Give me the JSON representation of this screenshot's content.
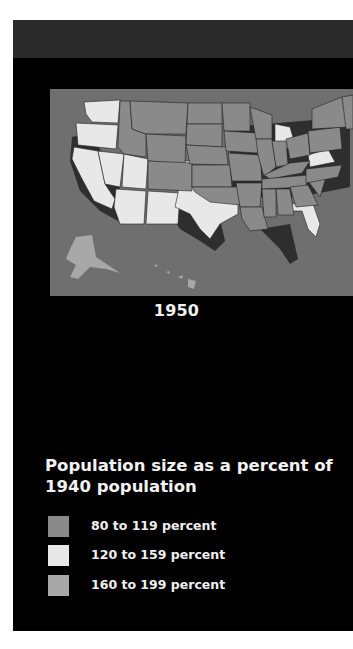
{
  "figure": {
    "year_label": "1950"
  },
  "legend": {
    "title": "Population size as a percent of 1940 population",
    "title_line1": "Population size as a percent of",
    "title_line2": "1940 population",
    "items": [
      {
        "label": "80 to 119 percent",
        "color": "#8a8a8a"
      },
      {
        "label": "120 to 159 percent",
        "color": "#e8e8e8"
      },
      {
        "label": "160 to 199 percent",
        "color": "#a8a8a8"
      }
    ]
  },
  "colors": {
    "panel": "#000000",
    "header_band": "#2a2a2a",
    "map_plate": "#6f6f6f",
    "extrusion": "#2e2e2e"
  }
}
